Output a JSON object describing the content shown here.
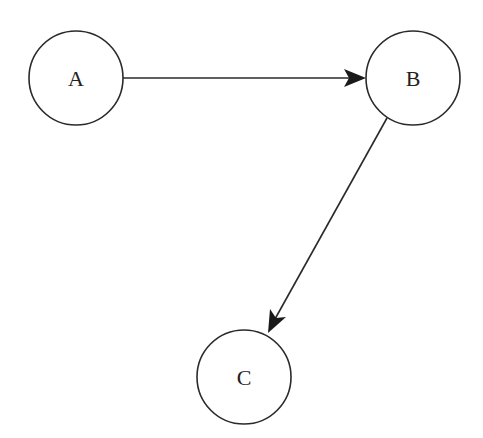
{
  "diagram": {
    "type": "directed-graph",
    "nodes": [
      {
        "id": "A",
        "label": "A",
        "cx": 76,
        "cy": 78,
        "r": 47
      },
      {
        "id": "B",
        "label": "B",
        "cx": 413,
        "cy": 78,
        "r": 47
      },
      {
        "id": "C",
        "label": "C",
        "cx": 244,
        "cy": 377,
        "r": 47
      }
    ],
    "edges": [
      {
        "from": "A",
        "to": "B",
        "directed": true
      },
      {
        "from": "B",
        "to": "C",
        "directed": true
      }
    ]
  },
  "colors": {
    "stroke": "#2a2a2a",
    "background": "#ffffff"
  }
}
